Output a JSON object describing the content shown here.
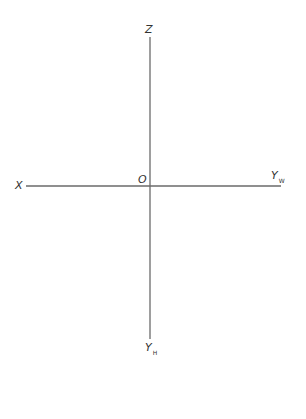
{
  "diagram": {
    "type": "three-projection-plane axes (unfolded)",
    "origin_label": "O",
    "axes": [
      {
        "id": "z",
        "label": "Z",
        "subscript": "",
        "direction": "up"
      },
      {
        "id": "x",
        "label": "X",
        "subscript": "",
        "direction": "left"
      },
      {
        "id": "yw",
        "label": "Y",
        "subscript": "W",
        "direction": "right"
      },
      {
        "id": "yh",
        "label": "Y",
        "subscript": "H",
        "direction": "down"
      }
    ],
    "line_color": "#6a6a6a",
    "label_color": "#333333"
  }
}
